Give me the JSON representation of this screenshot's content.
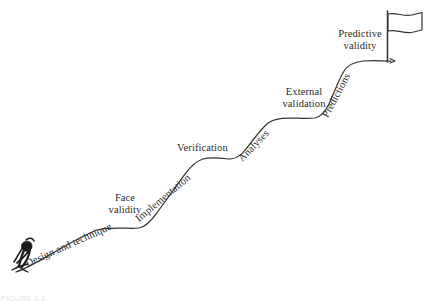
{
  "figure": {
    "caption": "FIGURE 1.1",
    "stroke_color": "#333333",
    "text_color": "#2b2b2b",
    "background_color": "#ffffff"
  },
  "climber": {
    "icon": "climbing-person-icon",
    "description": "hunched climber figure at the base of the slope"
  },
  "summit": {
    "flag_icon": "flag-icon",
    "pole_icon": "flagpole-icon"
  },
  "steps": [
    {
      "label": "Design and technique",
      "orientation": "diagonal",
      "angle": -24
    },
    {
      "label": "Face validity",
      "orientation": "horizontal",
      "line1": "Face",
      "line2": "validity"
    },
    {
      "label": "Implementation",
      "orientation": "diagonal",
      "angle": -40
    },
    {
      "label": "Verification",
      "orientation": "horizontal"
    },
    {
      "label": "Analyses",
      "orientation": "diagonal",
      "angle": -46
    },
    {
      "label": "External validation",
      "orientation": "horizontal",
      "line1": "External",
      "line2": "validation"
    },
    {
      "label": "Predictions",
      "orientation": "diagonal",
      "angle": -62
    },
    {
      "label": "Predictive validity",
      "orientation": "horizontal",
      "line1": "Predictive",
      "line2": "validity"
    }
  ]
}
